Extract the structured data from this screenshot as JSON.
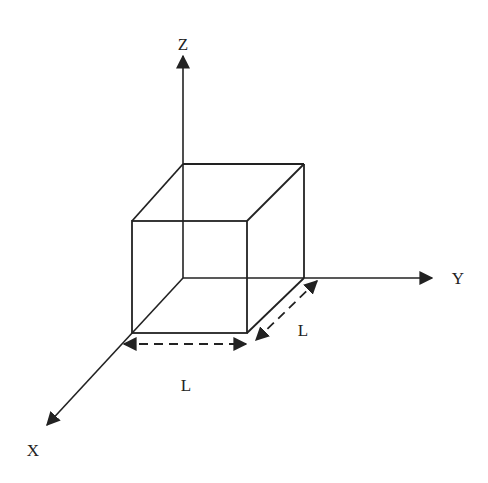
{
  "diagram": {
    "colors": {
      "stroke": "#222222",
      "background": "#ffffff"
    },
    "axes": {
      "x_label": "X",
      "y_label": "Y",
      "z_label": "Z"
    },
    "dimensions": {
      "front_edge_label": "L",
      "depth_edge_label": "L"
    }
  }
}
